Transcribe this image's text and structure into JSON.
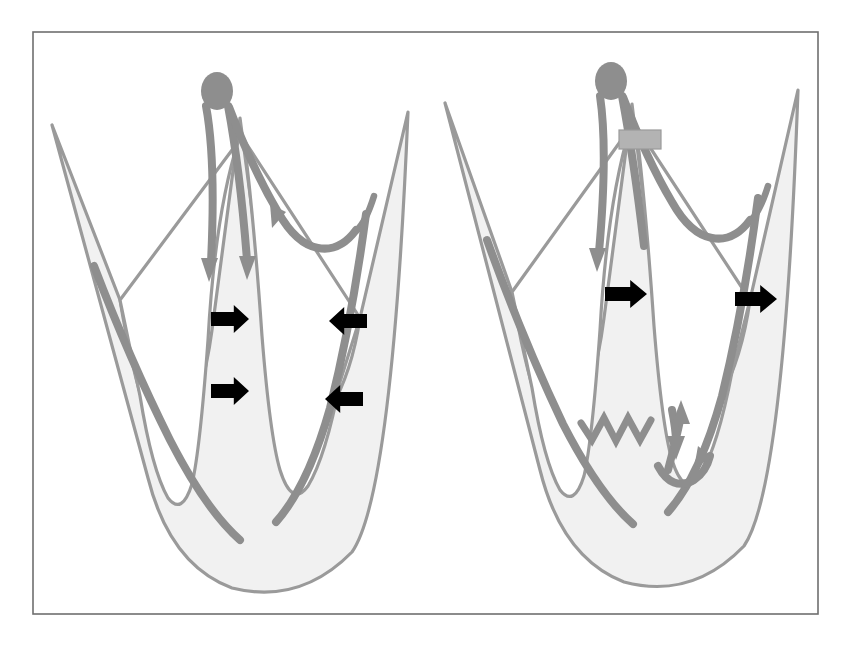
{
  "figure": {
    "frame": {
      "x": 33,
      "y": 32,
      "width": 785,
      "height": 582,
      "stroke": "#6f6f6f"
    },
    "canvas": {
      "width": 851,
      "height": 645,
      "background": "#ffffff"
    }
  },
  "colors": {
    "myocardium_fill": "#f1f1f1",
    "myocardium_stroke": "#9a9a9a",
    "cavity_fill": "#ffffff",
    "conduction_gray": "#8e8e8e",
    "node_gray": "#8e8e8e",
    "pacing_box_gray": "#b3b3b3",
    "arrow_black": "#000000",
    "frame_gray": "#6f6f6f"
  },
  "panels": [
    {
      "id": "left-panel",
      "name": "normal-conduction-panel",
      "label": "Normal intrinsic conduction",
      "node": {
        "name": "av-node-ellipse",
        "cx": 217,
        "cy": 91,
        "rx": 16,
        "ry": 19
      },
      "pacing_box": null,
      "black_arrows": [
        {
          "name": "septal-arrow-upper",
          "direction": "right",
          "x": 211,
          "y": 305,
          "width": 38,
          "height": 28
        },
        {
          "name": "septal-arrow-lower",
          "direction": "right",
          "x": 211,
          "y": 377,
          "width": 38,
          "height": 28
        },
        {
          "name": "lateral-arrow-upper",
          "direction": "left",
          "x": 329,
          "y": 307,
          "width": 38,
          "height": 28
        },
        {
          "name": "lateral-arrow-lower",
          "direction": "left",
          "x": 325,
          "y": 385,
          "width": 38,
          "height": 28
        }
      ],
      "conduction_arrowheads": [
        {
          "name": "septal-conduction-arrowhead",
          "x": 209,
          "y": 268,
          "direction": "down"
        },
        {
          "name": "free-wall-conduction-arrowhead",
          "x": 247,
          "y": 266,
          "direction": "down"
        },
        {
          "name": "purkinje-arrowhead",
          "x": 280,
          "y": 215,
          "direction": "down-right"
        }
      ],
      "zigzag": null
    },
    {
      "id": "right-panel",
      "name": "paced-conduction-panel",
      "label": "Right ventricular apical pacing",
      "node": {
        "name": "av-node-ellipse",
        "cx": 611,
        "cy": 81,
        "rx": 16,
        "ry": 19
      },
      "pacing_box": {
        "name": "pacing-lead-marker",
        "x": 619,
        "y": 130,
        "width": 42,
        "height": 19
      },
      "black_arrows": [
        {
          "name": "septal-arrow",
          "direction": "right",
          "x": 605,
          "y": 280,
          "width": 42,
          "height": 28
        },
        {
          "name": "lateral-arrow",
          "direction": "right",
          "x": 735,
          "y": 285,
          "width": 42,
          "height": 28
        }
      ],
      "conduction_arrowheads": [
        {
          "name": "septal-conduction-arrowhead",
          "x": 597,
          "y": 258,
          "direction": "down"
        },
        {
          "name": "paced-wavefront-arrowhead-up",
          "x": 681,
          "y": 410,
          "direction": "up"
        },
        {
          "name": "paced-wavefront-arrowhead-down",
          "x": 676,
          "y": 447,
          "direction": "down"
        },
        {
          "name": "apical-wavefront-arrowhead",
          "x": 688,
          "y": 462,
          "direction": "right"
        }
      ],
      "zigzag": {
        "name": "pacing-stimulus-zigzag",
        "points": "581,423 592,440 604,418 616,441 628,418 640,440 651,420"
      }
    }
  ],
  "legend_text": {
    "panel_a_caption": "",
    "panel_b_caption": ""
  }
}
